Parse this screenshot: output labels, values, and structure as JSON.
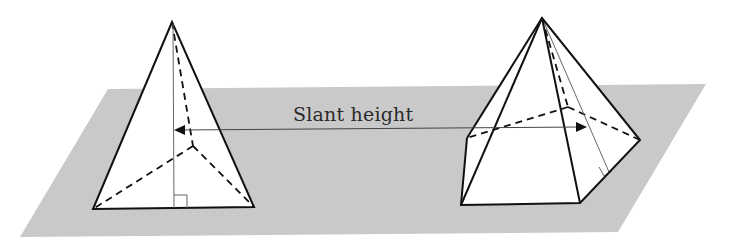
{
  "diagram": {
    "label": "Slant height",
    "colors": {
      "plane": "#c9c9c9",
      "face": "#ffffff",
      "edge": "#111111",
      "thin": "#555555"
    },
    "shapes": [
      {
        "name": "triangular-pyramid",
        "right_angle_marker": true
      },
      {
        "name": "square-pyramid",
        "right_angle_marker": true
      }
    ]
  }
}
